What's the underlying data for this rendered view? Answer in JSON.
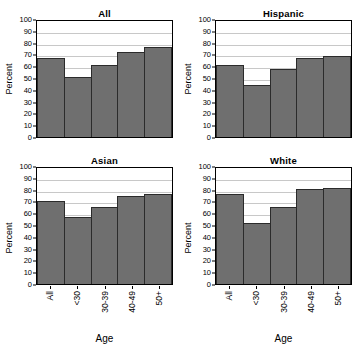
{
  "figure": {
    "panel_titles": [
      "All",
      "Hispanic",
      "Asian",
      "White"
    ],
    "axis": {
      "ylabel": "Percent",
      "xlabel": "Age",
      "yticks": [
        "0",
        "10",
        "20",
        "30",
        "40",
        "50",
        "60",
        "70",
        "80",
        "90",
        "100"
      ],
      "xticks": [
        "All",
        "<30",
        "30-39",
        "40-49",
        "50+"
      ]
    },
    "colors": {
      "bar_fill": "#6f6f6f",
      "bar_edge": "#2b2b2b",
      "gridline": "#c8c8c8",
      "axis": "#000000",
      "background": "#ffffff"
    }
  },
  "chart_data": [
    {
      "type": "bar",
      "title": "All",
      "categories": [
        "All",
        "<30",
        "30-39",
        "40-49",
        "50+"
      ],
      "values": [
        67,
        51,
        61,
        72,
        76
      ],
      "xlabel": "Age",
      "ylabel": "Percent",
      "ylim": [
        0,
        100
      ],
      "ytick_step": 10,
      "grid": true,
      "legend": "none"
    },
    {
      "type": "bar",
      "title": "Hispanic",
      "categories": [
        "All",
        "<30",
        "30-39",
        "40-49",
        "50+"
      ],
      "values": [
        61,
        44.5,
        57.5,
        67,
        69
      ],
      "xlabel": "Age",
      "ylabel": "Percent",
      "ylim": [
        0,
        100
      ],
      "ytick_step": 10,
      "grid": true,
      "legend": "none"
    },
    {
      "type": "bar",
      "title": "Asian",
      "categories": [
        "All",
        "<30",
        "30-39",
        "40-49",
        "50+"
      ],
      "values": [
        70.5,
        56.5,
        65,
        74.5,
        76.5
      ],
      "xlabel": "Age",
      "ylabel": "Percent",
      "ylim": [
        0,
        100
      ],
      "ytick_step": 10,
      "grid": true,
      "legend": "none"
    },
    {
      "type": "bar",
      "title": "White",
      "categories": [
        "All",
        "<30",
        "30-39",
        "40-49",
        "50+"
      ],
      "values": [
        76,
        52,
        65,
        80.5,
        81.5
      ],
      "xlabel": "Age",
      "ylabel": "Percent",
      "ylim": [
        0,
        100
      ],
      "ytick_step": 10,
      "grid": true,
      "legend": "none"
    }
  ]
}
